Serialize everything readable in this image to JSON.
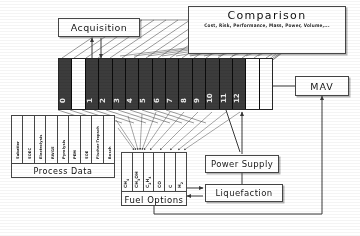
{
  "diagram": {
    "title_boxes": {
      "acquisition": "Acquisition",
      "mav": "MAV",
      "power_supply": "Power Supply",
      "liquefaction": "Liquefaction"
    },
    "comparison": {
      "title": "Comparison",
      "criteria": "Cost, Risk, Performance, Mass, Power, Volume,..."
    },
    "process_data": {
      "footer_label": "Process Data",
      "items": [
        "Sabatier",
        "SOEC",
        "Electrolysis",
        "RWGS",
        "Pyrolysis",
        "PEM",
        "SOE",
        "Fischer-Tropsch",
        "Bosch"
      ]
    },
    "fuel_options": {
      "footer_label": "Fuel Options",
      "items": [
        "CH4",
        "CH3OH",
        "C2H4",
        "CO",
        "C",
        "H2"
      ]
    },
    "block": {
      "cells": [
        "0",
        "",
        "1",
        "2",
        "3",
        "4",
        "5",
        "6",
        "7",
        "8",
        "9",
        "10",
        "11",
        "12",
        "",
        ""
      ]
    },
    "colors": {
      "block_fill": "#3f3f3f",
      "line": "#4b4b4b",
      "border": "#4a4a4a",
      "background": "#fdfdfd"
    }
  }
}
